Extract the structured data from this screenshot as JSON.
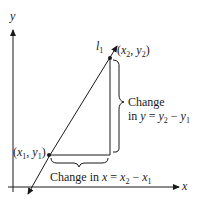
{
  "diagram": {
    "axes": {
      "x_label": "x",
      "y_label": "y"
    },
    "line": {
      "label": "l",
      "label_sub": "1"
    },
    "points": {
      "p1": {
        "open": "(",
        "x": "x",
        "x_sub": "1",
        "sep": ", ",
        "y": "y",
        "y_sub": "1",
        "close": ")"
      },
      "p2": {
        "open": "(",
        "x": "x",
        "x_sub": "2",
        "sep": ", ",
        "y": "y",
        "y_sub": "2",
        "close": ")"
      }
    },
    "change_y": {
      "line1": "Change",
      "line2_prefix": "in ",
      "var": "y",
      "eq": " = ",
      "a": "y",
      "a_sub": "2",
      "minus": " − ",
      "b": "y",
      "b_sub": "1"
    },
    "change_x": {
      "prefix": "Change in ",
      "var": "x",
      "eq": " = ",
      "a": "x",
      "a_sub": "2",
      "minus": " − ",
      "b": "x",
      "b_sub": "1"
    },
    "colors": {
      "ink": "#1a1a1a",
      "background": "#ffffff"
    }
  }
}
